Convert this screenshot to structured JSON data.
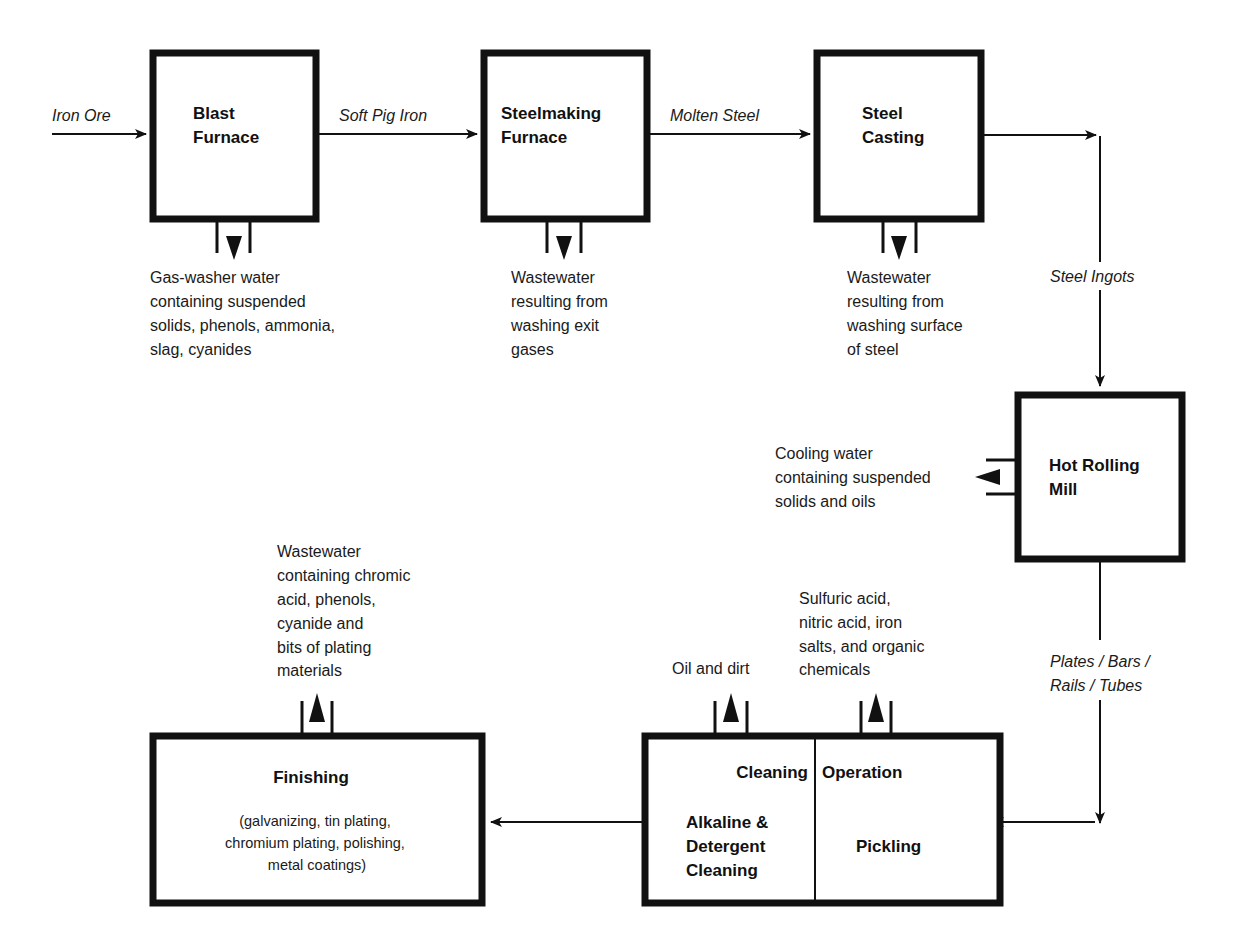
{
  "diagram": {
    "type": "process-flow",
    "colors": {
      "ink": "#111111",
      "background": "#ffffff"
    }
  },
  "nodes": {
    "blast_furnace": {
      "line1": "Blast",
      "line2": "Furnace"
    },
    "steelmaking_furnace": {
      "line1": "Steelmaking",
      "line2": "Furnace"
    },
    "steel_casting": {
      "line1": "Steel",
      "line2": "Casting"
    },
    "hot_rolling_mill": {
      "line1": "Hot Rolling",
      "line2": "Mill"
    },
    "cleaning_operation": {
      "header_left": "Cleaning",
      "header_right": "Operation",
      "left": {
        "line1": "Alkaline &",
        "line2": "Detergent",
        "line3": "Cleaning"
      },
      "right": {
        "line1": "Pickling"
      }
    },
    "finishing": {
      "title": "Finishing",
      "sub1": "(galvanizing, tin plating,",
      "sub2": "chromium plating, polishing,",
      "sub3": "metal coatings)"
    }
  },
  "flows": {
    "iron_ore": "Iron Ore",
    "soft_pig_iron": "Soft Pig Iron",
    "molten_steel": "Molten Steel",
    "steel_ingots": "Steel Ingots",
    "plates_line1": "Plates / Bars /",
    "plates_line2": "Rails / Tubes"
  },
  "wastes": {
    "blast_furnace": [
      "Gas-washer water",
      "containing suspended",
      "solids, phenols, ammonia,",
      "slag, cyanides"
    ],
    "steelmaking_furnace": [
      "Wastewater",
      "resulting from",
      "washing exit",
      "gases"
    ],
    "steel_casting": [
      "Wastewater",
      "resulting from",
      "washing surface",
      "of steel"
    ],
    "hot_rolling_mill": [
      "Cooling water",
      "containing suspended",
      "solids and oils"
    ],
    "alkaline_cleaning": [
      "Oil and dirt"
    ],
    "pickling": [
      "Sulfuric acid,",
      "nitric acid, iron",
      "salts, and organic",
      "chemicals"
    ],
    "finishing": [
      "Wastewater",
      "containing chromic",
      "acid, phenols,",
      "cyanide and",
      "bits of plating",
      "materials"
    ]
  }
}
